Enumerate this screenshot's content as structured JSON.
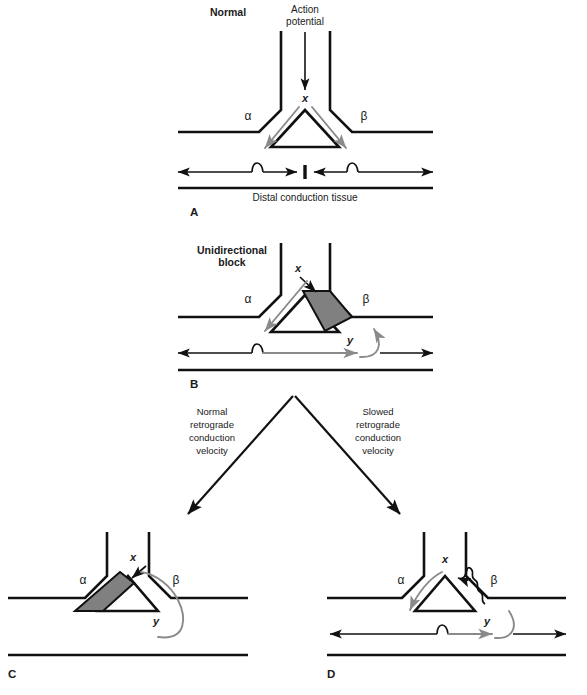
{
  "figure": {
    "background_color": "#ffffff",
    "ink_color": "#111111",
    "gray_arrow_color": "#8a8a8a",
    "block_fill_color": "#808080"
  },
  "panels": [
    {
      "id": "A",
      "letter": "A",
      "title": "Normal",
      "stimulus_label_line1": "Action",
      "stimulus_label_line2": "potential",
      "limb_alpha": "α",
      "limb_beta": "β",
      "site_x": "x",
      "tissue_caption": "Distal conduction tissue",
      "description": "Impulse enters at x, divides down both alpha and beta limbs, and the two wavefronts collide in the distal conduction tissue."
    },
    {
      "id": "B",
      "letter": "B",
      "title_line1": "Unidirectional",
      "title_line2": "block",
      "limb_alpha": "α",
      "limb_beta": "β",
      "site_x": "x",
      "site_y": "y",
      "description": "Antegrade block in the beta limb. The impulse travels down alpha, across distal tissue, and re-enters the beta limb retrogradely at y."
    },
    {
      "id": "C",
      "letter": "C",
      "limb_alpha": "α",
      "limb_beta": "β",
      "site_x": "x",
      "site_y": "y",
      "description": "Normal retrograde conduction velocity: the returning wavefront reaches x while the alpha limb is still refractory, so reentry is extinguished."
    },
    {
      "id": "D",
      "letter": "D",
      "limb_alpha": "α",
      "limb_beta": "β",
      "site_x": "x",
      "site_y": "y",
      "description": "Slowed retrograde conduction velocity: the alpha limb has recovered by the time the impulse returns to x, establishing a sustained reentrant circuit."
    }
  ],
  "branch_labels": {
    "left": {
      "line1": "Normal",
      "line2": "retrograde",
      "line3": "conduction",
      "line4": "velocity"
    },
    "right": {
      "line1": "Slowed",
      "line2": "retrograde",
      "line3": "conduction",
      "line4": "velocity"
    }
  }
}
